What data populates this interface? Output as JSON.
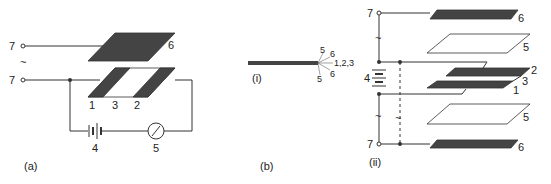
{
  "figure": {
    "panels": [
      {
        "id": "a",
        "caption": "(a)"
      },
      {
        "id": "b",
        "caption": "(b)",
        "sub": "(i)"
      },
      {
        "id": "ii",
        "caption": "(ii)"
      }
    ],
    "labels": {
      "terminal": "7",
      "ac": "~",
      "electrode_1": "1",
      "gap_3": "3",
      "electrode_2": "2",
      "battery": "4",
      "meter": "5",
      "plate_6": "6",
      "layer_5": "5",
      "layer_6": "6",
      "layers_123": "1,2,3"
    },
    "colors": {
      "plate": "#444444",
      "line": "#333333",
      "background": "#ffffff"
    }
  }
}
